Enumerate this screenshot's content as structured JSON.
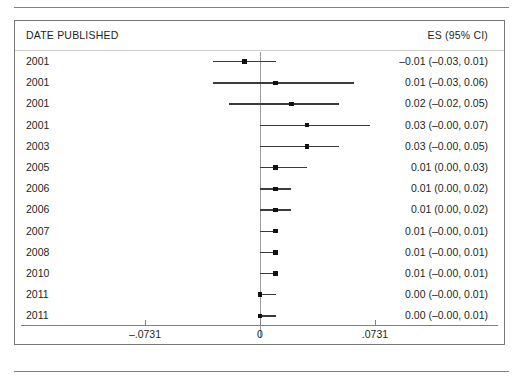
{
  "figure": {
    "type": "forest-plot",
    "columns": {
      "left_header": "DATE PUBLISHED",
      "right_header": "ES (95% CI)"
    }
  },
  "chart_data": {
    "type": "scatter",
    "title": "",
    "subtitle": "",
    "xlabel": "",
    "ylabel": "",
    "grid": false,
    "legend": false,
    "axis": {
      "zero_reference": 0,
      "ticks": [
        -0.0731,
        0,
        0.0731
      ],
      "tick_labels": [
        "–.0731",
        "0",
        ".0731"
      ],
      "xlim": [
        -0.0731,
        0.0731
      ]
    },
    "categories": [
      "2001",
      "2001",
      "2001",
      "2001",
      "2003",
      "2005",
      "2006",
      "2006",
      "2007",
      "2008",
      "2010",
      "2011",
      "2011"
    ],
    "series": [
      {
        "name": "Effect size (ES) with 95% CI",
        "points": [
          {
            "year": "2001",
            "es": -0.01,
            "lo": -0.03,
            "hi": 0.01,
            "es_text": "–0.01 (–0.03, 0.01)"
          },
          {
            "year": "2001",
            "es": 0.01,
            "lo": -0.03,
            "hi": 0.06,
            "es_text": "0.01 (–0.03, 0.06)"
          },
          {
            "year": "2001",
            "es": 0.02,
            "lo": -0.02,
            "hi": 0.05,
            "es_text": "0.02 (–0.02, 0.05)"
          },
          {
            "year": "2001",
            "es": 0.03,
            "lo": -0.0,
            "hi": 0.07,
            "es_text": "0.03 (–0.00, 0.07)"
          },
          {
            "year": "2003",
            "es": 0.03,
            "lo": -0.0,
            "hi": 0.05,
            "es_text": "0.03 (–0.00, 0.05)"
          },
          {
            "year": "2005",
            "es": 0.01,
            "lo": 0.0,
            "hi": 0.03,
            "es_text": "0.01   (0.00, 0.03)"
          },
          {
            "year": "2006",
            "es": 0.01,
            "lo": 0.0,
            "hi": 0.02,
            "es_text": "0.01   (0.00, 0.02)"
          },
          {
            "year": "2006",
            "es": 0.01,
            "lo": 0.0,
            "hi": 0.02,
            "es_text": "0.01   (0.00, 0.02)"
          },
          {
            "year": "2007",
            "es": 0.01,
            "lo": -0.0,
            "hi": 0.01,
            "es_text": "0.01 (–0.00, 0.01)"
          },
          {
            "year": "2008",
            "es": 0.01,
            "lo": -0.0,
            "hi": 0.01,
            "es_text": "0.01 (–0.00, 0.01)"
          },
          {
            "year": "2010",
            "es": 0.01,
            "lo": -0.0,
            "hi": 0.01,
            "es_text": "0.01 (–0.00, 0.01)"
          },
          {
            "year": "2011",
            "es": 0.0,
            "lo": -0.0,
            "hi": 0.01,
            "es_text": "0.00 (–0.00, 0.01)"
          },
          {
            "year": "2011",
            "es": 0.0,
            "lo": -0.0,
            "hi": 0.01,
            "es_text": "0.00 (–0.00, 0.01)"
          }
        ]
      }
    ]
  },
  "style": {
    "marker_color": "#111111",
    "line_color": "#3b3b3b",
    "zero_line_color": "#9a9a9a",
    "frame_color": "#777777",
    "text_color": "#231f20"
  }
}
